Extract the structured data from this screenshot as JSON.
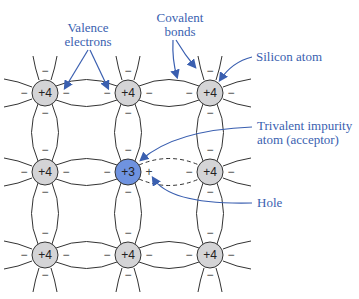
{
  "labels": {
    "valence": [
      "Valence",
      "electrons"
    ],
    "covalent": [
      "Covalent",
      "bonds"
    ],
    "silicon": "Silicon atom",
    "trivalent": [
      "Trivalent impurity",
      "atom (acceptor)"
    ],
    "hole": "Hole"
  },
  "atoms": {
    "silicon_charge": "+4",
    "impurity_charge": "+3",
    "electron_symbol": "−",
    "hole_symbol": "+"
  },
  "colors": {
    "label": "#3a5fb0",
    "silicon_fill": "#d4d4d6",
    "impurity_fill": "#6f93e0",
    "line": "#333333"
  }
}
